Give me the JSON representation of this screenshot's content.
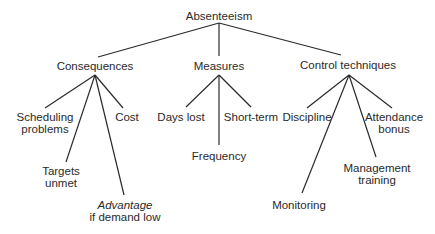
{
  "diagram": {
    "type": "tree",
    "root": "Absenteeism",
    "nodes": {
      "root": {
        "label": "Absenteeism"
      },
      "consequences": {
        "label": "Consequences"
      },
      "measures": {
        "label": "Measures"
      },
      "control": {
        "label": "Control techniques"
      },
      "scheduling": {
        "line1": "Scheduling",
        "line2": "problems"
      },
      "targets": {
        "line1": "Targets",
        "line2": "unmet"
      },
      "cost": {
        "label": "Cost"
      },
      "advantage": {
        "line1": "Advantage",
        "line2": "if demand low"
      },
      "days_lost": {
        "label": "Days lost"
      },
      "frequency": {
        "label": "Frequency"
      },
      "short_term": {
        "label": "Short-term"
      },
      "discipline": {
        "label": "Discipline"
      },
      "monitoring": {
        "label": "Monitoring"
      },
      "management": {
        "line1": "Management",
        "line2": "training"
      },
      "attendance": {
        "line1": "Attendance",
        "line2": "bonus"
      }
    },
    "edges": [
      [
        "Absenteeism",
        "Consequences"
      ],
      [
        "Absenteeism",
        "Measures"
      ],
      [
        "Absenteeism",
        "Control techniques"
      ],
      [
        "Consequences",
        "Scheduling problems"
      ],
      [
        "Consequences",
        "Targets unmet"
      ],
      [
        "Consequences",
        "Advantage if demand low"
      ],
      [
        "Consequences",
        "Cost"
      ],
      [
        "Measures",
        "Days lost"
      ],
      [
        "Measures",
        "Frequency"
      ],
      [
        "Measures",
        "Short-term"
      ],
      [
        "Control techniques",
        "Discipline"
      ],
      [
        "Control techniques",
        "Monitoring"
      ],
      [
        "Control techniques",
        "Management training"
      ],
      [
        "Control techniques",
        "Attendance bonus"
      ]
    ],
    "line_color": "#2a2a2a"
  }
}
